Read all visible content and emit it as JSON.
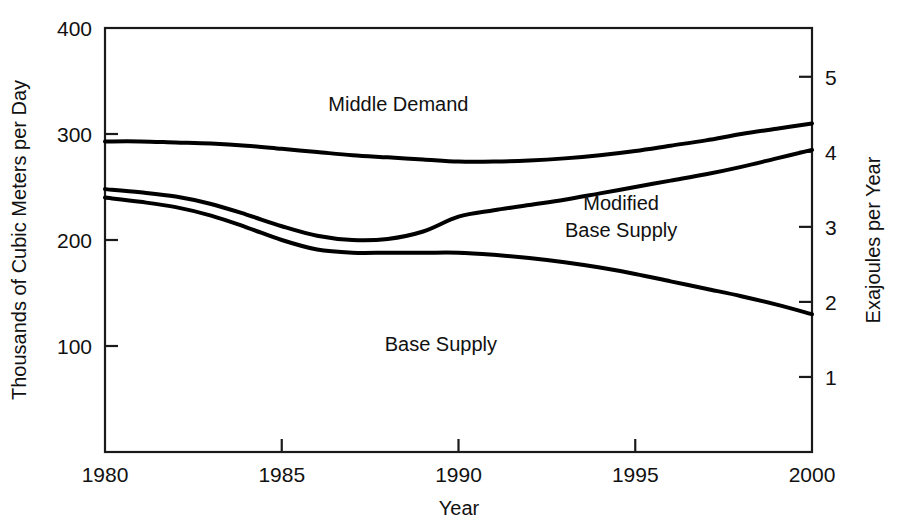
{
  "chart_data": {
    "type": "line",
    "title": "",
    "subtitle": "",
    "xlabel": "Year",
    "ylabel": "Thousands of Cubic Meters per Day",
    "ylabel_right": "Exajoules per Year",
    "xlim": [
      1980,
      2000
    ],
    "ylim": [
      0,
      400
    ],
    "ylim_right": [
      0,
      5.65
    ],
    "grid": false,
    "legend_position": "inline-annotations",
    "xticks": [
      1980,
      1985,
      1990,
      1995,
      2000
    ],
    "xtick_labels": [
      "1980",
      "1985",
      "1990",
      "1995",
      "2000"
    ],
    "yticks": [
      100,
      200,
      300,
      400
    ],
    "ytick_labels": [
      "100",
      "200",
      "300",
      "400"
    ],
    "yticks_right": [
      1,
      2,
      3,
      4,
      5
    ],
    "ytick_labels_right": [
      "1",
      "2",
      "3",
      "4",
      "5"
    ],
    "x": [
      1980,
      1981,
      1982,
      1983,
      1984,
      1985,
      1986,
      1987,
      1988,
      1989,
      1990,
      1991,
      1992,
      1993,
      1994,
      1995,
      1996,
      1997,
      1998,
      1999,
      2000
    ],
    "series": [
      {
        "name": "Middle Demand",
        "label": "Middle Demand",
        "label_x": 1988.3,
        "label_y": 322,
        "values": [
          293,
          293,
          292,
          291,
          289,
          286,
          283,
          280,
          278,
          276,
          274,
          274,
          275,
          277,
          280,
          284,
          289,
          294,
          300,
          305,
          310
        ]
      },
      {
        "name": "Modified Base Supply",
        "label": "Modified Base Supply",
        "label_x": 1994.6,
        "label_y": 228,
        "values": [
          248,
          245,
          241,
          234,
          224,
          213,
          204,
          200,
          201,
          208,
          222,
          228,
          233,
          238,
          244,
          250,
          256,
          262,
          269,
          277,
          285
        ]
      },
      {
        "name": "Base Supply",
        "label": "Base Supply",
        "label_x": 1989.5,
        "label_y": 95,
        "values": [
          240,
          236,
          231,
          223,
          212,
          200,
          191,
          188,
          188,
          188,
          188,
          186,
          183,
          179,
          174,
          168,
          161,
          154,
          147,
          139,
          130
        ]
      }
    ],
    "colors": {
      "line": "#000000",
      "axis": "#1a1a1a",
      "background": "#ffffff"
    },
    "line_width": 4
  },
  "plot_geometry": {
    "left": 105,
    "right": 812,
    "top": 28,
    "bottom": 452
  }
}
